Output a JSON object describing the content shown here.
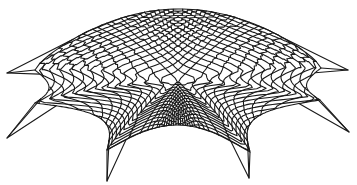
{
  "figure": {
    "width": 357,
    "height": 185,
    "background": "#ffffff",
    "stroke_color": "#1a1a1a",
    "stroke_width": 1.1,
    "center": [
      178,
      95
    ],
    "crown_y": 10,
    "grid_divisions": 22,
    "supports": [
      {
        "name": "left",
        "tip": [
          7,
          73
        ],
        "kink": [
          35,
          70
        ]
      },
      {
        "name": "left-lower",
        "tip": [
          7,
          138
        ],
        "kink": [
          35,
          103
        ]
      },
      {
        "name": "bottom-left",
        "tip": [
          107,
          181
        ],
        "kink": [
          107,
          150
        ]
      },
      {
        "name": "bottom-right",
        "tip": [
          249,
          178
        ],
        "kink": [
          250,
          152
        ]
      },
      {
        "name": "right-lower",
        "tip": [
          349,
          132
        ],
        "kink": [
          320,
          100
        ]
      },
      {
        "name": "right",
        "tip": [
          348,
          70
        ],
        "kink": [
          321,
          68
        ]
      }
    ]
  }
}
